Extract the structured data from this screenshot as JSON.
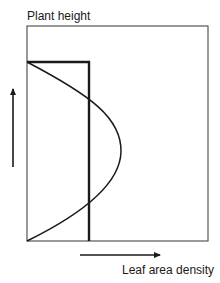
{
  "diagram": {
    "y_axis_label": "Plant height",
    "x_axis_label": "Leaf area density",
    "colors": {
      "frame": "#555555",
      "lines": "#1a1a1a",
      "background": "#ffffff"
    },
    "elements": [
      {
        "type": "frame",
        "description": "rectangular plot area"
      },
      {
        "type": "step-profile",
        "description": "uniform leaf area density profile: constant from ground to top of canopy"
      },
      {
        "type": "curve-profile",
        "description": "parabolic leaf area density profile peaking at mid-height"
      },
      {
        "type": "arrow",
        "direction": "up",
        "meaning": "increasing plant height"
      },
      {
        "type": "arrow",
        "direction": "right",
        "meaning": "increasing leaf area density"
      }
    ]
  }
}
